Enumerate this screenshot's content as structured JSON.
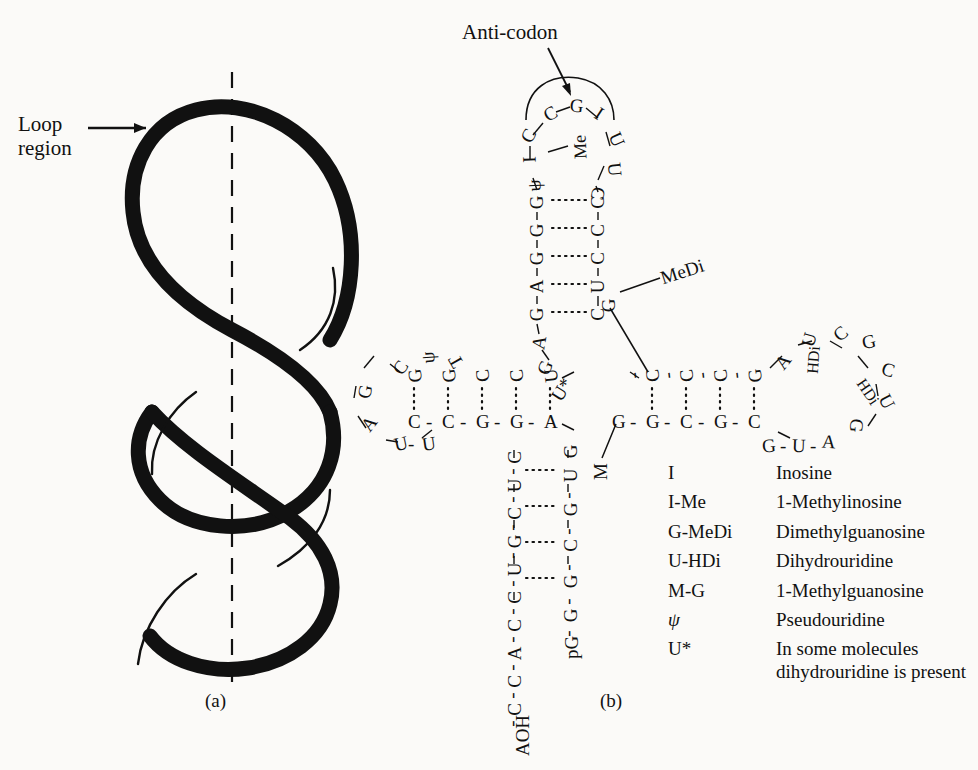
{
  "figure": {
    "panel_a_caption": "(a)",
    "panel_b_caption": "(b)"
  },
  "panel_a": {
    "label": "Loop\nregion",
    "label_line1": "Loop",
    "label_line2": "region",
    "description": "RNA single-strand helix with loop region, dashed central axis"
  },
  "panel_b": {
    "anticodon_label": "Anti-codon",
    "modified_labels": {
      "medi": "MeDi",
      "m": "M"
    },
    "anticodon_loop": {
      "bases": [
        "C",
        "C",
        "G",
        "I",
        "U",
        "U",
        "C"
      ],
      "modifier_me": "Me",
      "modifier_psi": "ψ",
      "modifier_i": "I"
    },
    "anticodon_stem": {
      "left_strand": [
        "G",
        "G",
        "G",
        "A",
        "G",
        "A",
        "G",
        "U*"
      ],
      "right_strand": [
        "C",
        "C",
        "C",
        "U",
        "C",
        "G"
      ]
    },
    "t_loop": {
      "loop_bases": [
        "C",
        "ψ",
        "T",
        "G",
        "A",
        "U",
        "U"
      ],
      "top_strand": [
        "G",
        "G",
        "C",
        "C",
        "U"
      ],
      "bottom_strand": [
        "C",
        "C",
        "G",
        "G",
        "A"
      ]
    },
    "d_loop": {
      "top_strand": [
        "C",
        "C",
        "C",
        "G"
      ],
      "bottom_strand": [
        "G",
        "G",
        "C",
        "G",
        "C"
      ],
      "loop_bases": [
        "A",
        "U",
        "HDi",
        "C",
        "G",
        "C",
        "U",
        "HDi",
        "G",
        "A",
        "U",
        "G"
      ]
    },
    "acceptor_stem": {
      "five_prime": [
        "pG",
        "G",
        "G",
        "C",
        "G",
        "U",
        "G"
      ],
      "three_prime": [
        "C",
        "U",
        "C",
        "G",
        "U",
        "C",
        "C",
        "A",
        "C",
        "C",
        "AOH"
      ]
    }
  },
  "legend": {
    "rows": [
      {
        "symbol": "I",
        "definition": "Inosine"
      },
      {
        "symbol": "I-Me",
        "definition": "1-Methylinosine"
      },
      {
        "symbol": "G-MeDi",
        "definition": "Dimethylguanosine"
      },
      {
        "symbol": "U-HDi",
        "definition": "Dihydrouridine"
      },
      {
        "symbol": "M-G",
        "definition": "1-Methylguanosine"
      },
      {
        "symbol": "ψ",
        "definition": "Pseudouridine"
      },
      {
        "symbol": "U*",
        "definition": "In some molecules dihydrouridine is present"
      }
    ]
  },
  "colors": {
    "ink": "#111111",
    "paper": "#fbfaf8"
  }
}
